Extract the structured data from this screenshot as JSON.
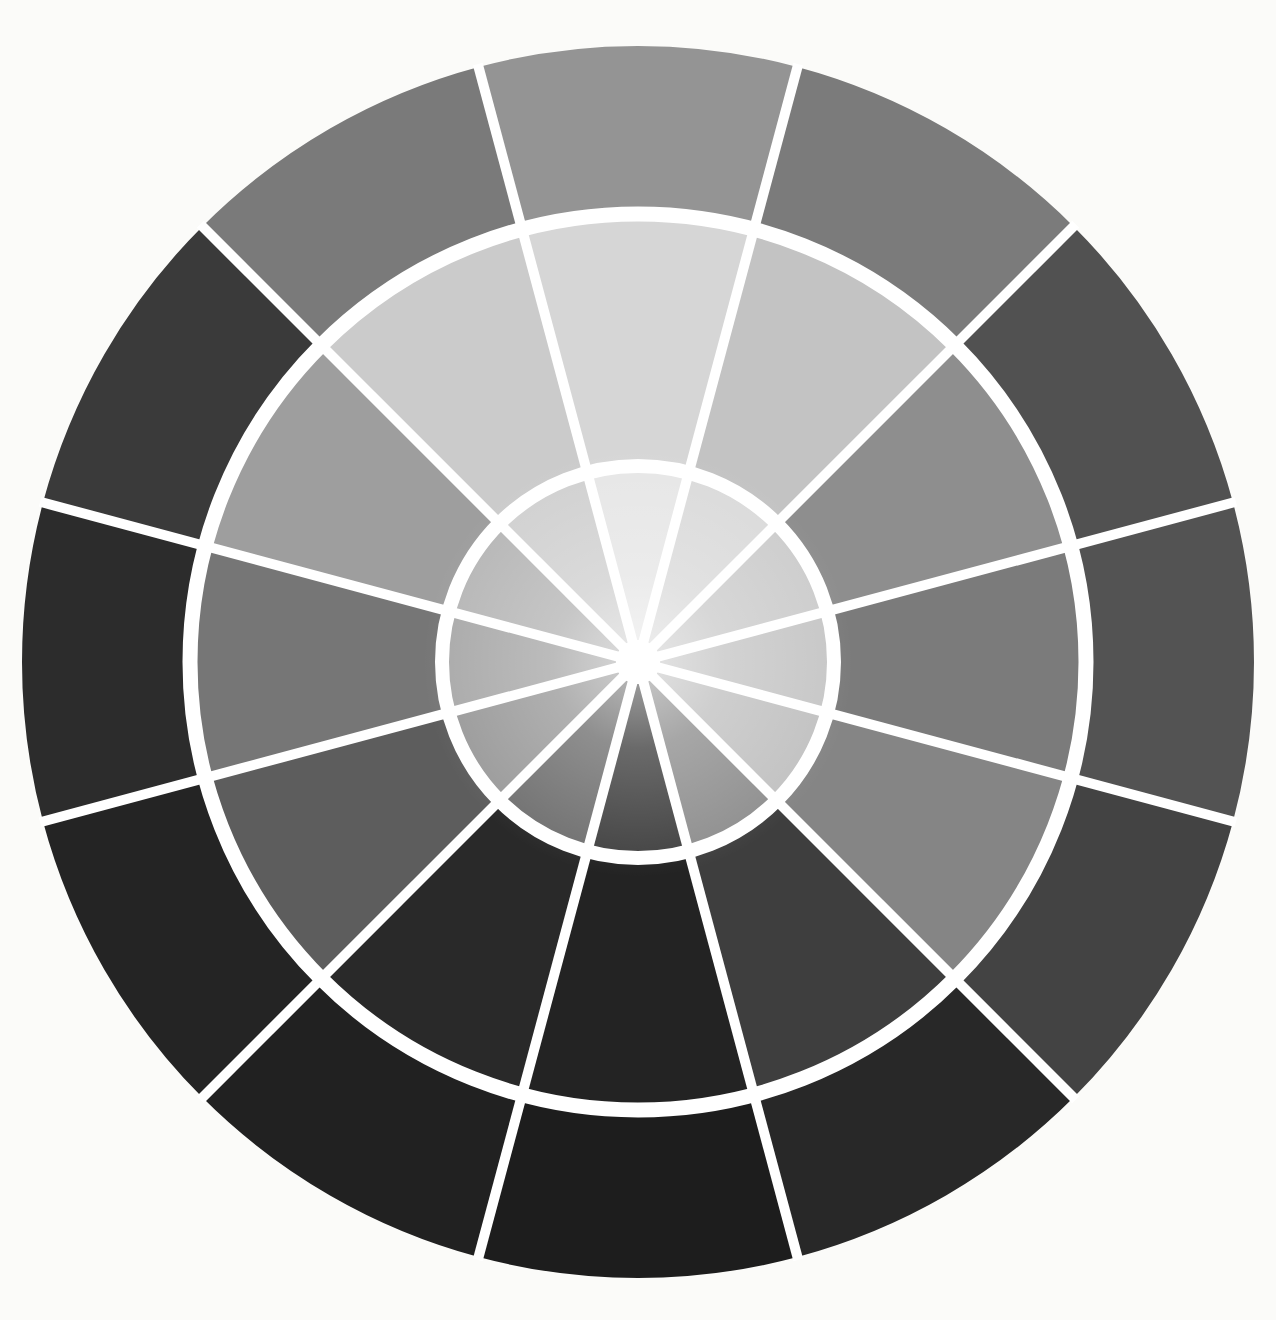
{
  "page": {
    "background_color": "#fbfbf9"
  },
  "wheel": {
    "type": "wheel",
    "description": "Twelve-sector grayscale value wheel with three concentric rings (inner tints, middle pure values, outer shades) separated by white radial lines and white ring dividers, white hub dot at center",
    "center": {
      "x": 638,
      "y": 662
    },
    "rings": [
      {
        "id": "inner",
        "r0": 22,
        "r1": 196
      },
      {
        "id": "middle",
        "r0": 196,
        "r1": 448
      },
      {
        "id": "outer",
        "r0": 448,
        "r1": 616
      }
    ],
    "sectors_per_ring": 12,
    "sector_span_deg": 30,
    "separator": {
      "color": "#ffffff",
      "radial_line_width": 10,
      "ring_gap_widths": [
        14,
        15
      ],
      "center_dot_radius": 22
    },
    "sectors": [
      {
        "hour": 12,
        "center_deg": 0,
        "values": {
          "inner": "#e6e6e6",
          "middle": "#d6d6d6",
          "outer": "#949494"
        }
      },
      {
        "hour": 1,
        "center_deg": 30,
        "values": {
          "inner": "#dadada",
          "middle": "#c3c3c3",
          "outer": "#7b7b7b"
        }
      },
      {
        "hour": 2,
        "center_deg": 60,
        "values": {
          "inner": "#cccccc",
          "middle": "#8e8e8e",
          "outer": "#515151"
        }
      },
      {
        "hour": 3,
        "center_deg": 90,
        "values": {
          "inner": "#c6c6c6",
          "middle": "#7b7b7b",
          "outer": "#535353"
        }
      },
      {
        "hour": 4,
        "center_deg": 120,
        "values": {
          "inner": "#c1c1c1",
          "middle": "#858585",
          "outer": "#434343"
        }
      },
      {
        "hour": 5,
        "center_deg": 150,
        "values": {
          "inner": "#8e8e8e",
          "middle": "#3e3e3e",
          "outer": "#282828"
        }
      },
      {
        "hour": 6,
        "center_deg": 180,
        "values": {
          "inner": "#404040",
          "middle": "#232323",
          "outer": "#1d1d1d"
        }
      },
      {
        "hour": 7,
        "center_deg": 210,
        "values": {
          "inner": "#6f6f6f",
          "middle": "#292929",
          "outer": "#212121"
        }
      },
      {
        "hour": 8,
        "center_deg": 240,
        "values": {
          "inner": "#9a9a9a",
          "middle": "#5d5d5d",
          "outer": "#242424"
        }
      },
      {
        "hour": 9,
        "center_deg": 270,
        "values": {
          "inner": "#a9a9a9",
          "middle": "#767676",
          "outer": "#2c2c2c"
        }
      },
      {
        "hour": 10,
        "center_deg": 300,
        "values": {
          "inner": "#b6b6b6",
          "middle": "#9e9e9e",
          "outer": "#3a3a3a"
        }
      },
      {
        "hour": 11,
        "center_deg": 330,
        "values": {
          "inner": "#d0d0d0",
          "middle": "#cbcbcb",
          "outer": "#7a7a7a"
        }
      }
    ]
  }
}
